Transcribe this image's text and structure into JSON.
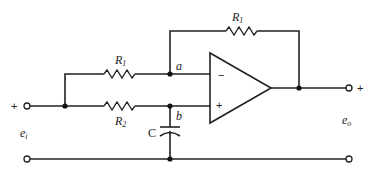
{
  "diagram": {
    "type": "op-amp circuit",
    "components": {
      "feedback_resistor": {
        "label": "R",
        "subscript": "1"
      },
      "input_resistor": {
        "label": "R",
        "subscript": "1"
      },
      "series_resistor": {
        "label": "R",
        "subscript": "2"
      },
      "capacitor": {
        "label": "C"
      },
      "opamp": {
        "inverting_sign": "−",
        "noninverting_sign": "+"
      }
    },
    "nodes": {
      "a": "a",
      "b": "b"
    },
    "input": {
      "plus": "+",
      "label": "e",
      "subscript": "i"
    },
    "output": {
      "plus": "+",
      "label": "e",
      "subscript": "o"
    }
  }
}
